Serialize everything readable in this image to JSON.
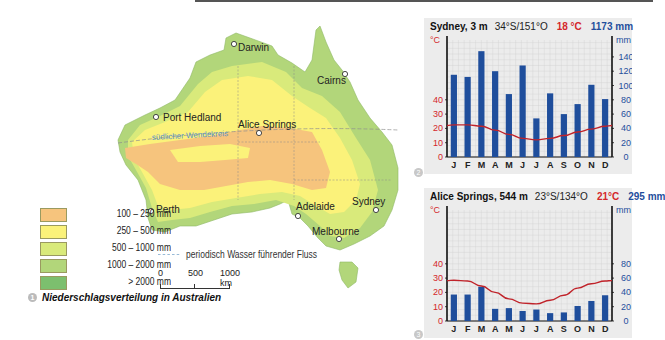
{
  "map": {
    "caption_number": "1",
    "caption": "Niederschlagsverteilung in Australien",
    "cities": [
      {
        "name": "Darwin",
        "x": 234,
        "y": 44,
        "lx": 238,
        "ly": 51
      },
      {
        "name": "Cairns",
        "x": 345,
        "y": 74,
        "lx": 317,
        "ly": 84
      },
      {
        "name": "Port Hedland",
        "x": 156,
        "y": 117,
        "lx": 163,
        "ly": 121
      },
      {
        "name": "Alice Springs",
        "x": 259,
        "y": 133,
        "lx": 238,
        "ly": 128
      },
      {
        "name": "Perth",
        "x": 151,
        "y": 211,
        "lx": 156,
        "ly": 213
      },
      {
        "name": "Adelaide",
        "x": 298,
        "y": 216,
        "lx": 296,
        "ly": 210
      },
      {
        "name": "Sydney",
        "x": 376,
        "y": 210,
        "lx": 352,
        "ly": 205
      },
      {
        "name": "Melbourne",
        "x": 339,
        "y": 239,
        "lx": 312,
        "ly": 235
      }
    ],
    "tropic_label": "südlicher Wendekreis",
    "legend": [
      {
        "label": "100 –   250 mm",
        "color": "#f6c47d"
      },
      {
        "label": "250 –   500 mm",
        "color": "#fbf27a"
      },
      {
        "label": "500 – 1000 mm",
        "color": "#d9ea7b"
      },
      {
        "label": "1000 – 2000 mm",
        "color": "#b2d67a"
      },
      {
        "label": "> 2000 mm",
        "color": "#7cbf6e"
      }
    ],
    "river_legend": "periodisch Wasser führender Fluss",
    "scale": {
      "labels": [
        "0",
        "500",
        "1000 km"
      ]
    }
  },
  "chart_data": [
    {
      "type": "bar+line",
      "title": "Sydney, 3 m",
      "coords": "34°S/151°O",
      "mean_temp": "18 °C",
      "annual_precip": "1173 mm",
      "categories": [
        "J",
        "F",
        "M",
        "A",
        "M",
        "J",
        "J",
        "A",
        "S",
        "O",
        "N",
        "D"
      ],
      "series": [
        {
          "name": "Niederschlag (mm)",
          "type": "bar",
          "color": "#1f4e9c",
          "values": [
            115,
            112,
            148,
            120,
            88,
            128,
            54,
            89,
            60,
            74,
            101,
            81
          ]
        },
        {
          "name": "Temperatur (°C)",
          "type": "line",
          "color": "#c0232a",
          "values": [
            22.5,
            22.5,
            21.5,
            18.8,
            15.8,
            13,
            12,
            13,
            15,
            17.5,
            19.5,
            21.5
          ]
        }
      ],
      "left_axis": {
        "label": "°C",
        "ticks": [
          0,
          10,
          20,
          30,
          40
        ],
        "color": "#d4262b"
      },
      "right_axis": {
        "label": "mm",
        "ticks": [
          0,
          20,
          40,
          60,
          80,
          100,
          120,
          140
        ],
        "color": "#1f4e9c"
      },
      "panel_number": "2"
    },
    {
      "type": "bar+line",
      "title": "Alice Springs, 544 m",
      "coords": "23°S/134°O",
      "mean_temp": "21°C",
      "annual_precip": "295 mm",
      "categories": [
        "J",
        "F",
        "M",
        "A",
        "M",
        "J",
        "J",
        "A",
        "S",
        "O",
        "N",
        "D"
      ],
      "series": [
        {
          "name": "Niederschlag (mm)",
          "type": "bar",
          "color": "#1f4e9c",
          "values": [
            37,
            37,
            48,
            17,
            18,
            14,
            16,
            11,
            12,
            21,
            28,
            36
          ]
        },
        {
          "name": "Temperatur (°C)",
          "type": "line",
          "color": "#c0232a",
          "values": [
            28.5,
            28,
            24.5,
            20,
            15.5,
            12.5,
            12,
            14.5,
            18,
            23,
            26,
            28
          ]
        }
      ],
      "left_axis": {
        "label": "°C",
        "ticks": [
          0,
          10,
          20,
          30,
          40
        ],
        "color": "#d4262b"
      },
      "right_axis": {
        "label": "mm",
        "ticks": [
          0,
          20,
          40,
          60,
          80
        ],
        "color": "#1f4e9c"
      },
      "panel_number": "3"
    }
  ]
}
